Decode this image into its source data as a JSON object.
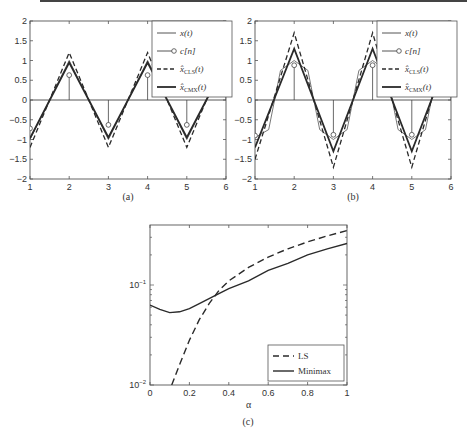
{
  "figure": {
    "captions": [
      "(a)",
      "(b)",
      "(c)"
    ]
  },
  "chart_data": [
    {
      "type": "line",
      "panel": "(a)",
      "title": "",
      "xlabel": "",
      "ylabel": "",
      "xlim": [
        1,
        6
      ],
      "ylim": [
        -2,
        2
      ],
      "xticks": [
        "1",
        "2",
        "3",
        "4",
        "5",
        "6"
      ],
      "yticks": [
        "-2",
        "-1.5",
        "-1",
        "-0.5",
        "0",
        "0.5",
        "1",
        "1.5",
        "2"
      ],
      "grid": false,
      "legend_position": "upper right",
      "legend": [
        "x(t)",
        "c[n]",
        "x̂_CLS(t)",
        "x̂_CMX(t)"
      ],
      "series": [
        {
          "name": "x(t)",
          "style": "thin solid",
          "x": [
            1,
            1.5,
            2,
            2.5,
            3,
            3.5,
            4,
            4.5,
            5,
            5.5,
            6
          ],
          "values": [
            -1,
            0,
            1,
            0,
            -1,
            0,
            1,
            0,
            -1,
            0,
            1
          ]
        },
        {
          "name": "c[n]",
          "style": "stem",
          "x": [
            1,
            2,
            3,
            4,
            5,
            6
          ],
          "values": [
            -0.72,
            0.63,
            -0.63,
            0.63,
            -0.63,
            0.63
          ]
        },
        {
          "name": "x̂_CLS(t)",
          "style": "dashed",
          "x": [
            1,
            2,
            3,
            4,
            5,
            6
          ],
          "values": [
            -1.2,
            1.2,
            -1.2,
            1.2,
            -1.2,
            1.2
          ]
        },
        {
          "name": "x̂_CMX(t)",
          "style": "thick solid",
          "x": [
            1,
            2,
            3,
            4,
            5,
            6
          ],
          "values": [
            -0.97,
            0.95,
            -0.95,
            0.95,
            -0.95,
            0.95
          ]
        }
      ]
    },
    {
      "type": "line",
      "panel": "(b)",
      "title": "",
      "xlabel": "",
      "ylabel": "",
      "xlim": [
        1,
        6
      ],
      "ylim": [
        -2,
        2
      ],
      "xticks": [
        "1",
        "2",
        "3",
        "4",
        "5",
        "6"
      ],
      "yticks": [
        "-2",
        "-1.5",
        "-1",
        "-0.5",
        "0",
        "0.5",
        "1",
        "1.5",
        "2"
      ],
      "grid": false,
      "legend_position": "upper right",
      "legend": [
        "x(t)",
        "c[n]",
        "x̂_CLS(t)",
        "x̂_CMX(t)"
      ],
      "series": [
        {
          "name": "x(t)",
          "style": "thin solid (trapezoid)",
          "x": [
            1,
            1.35,
            1.65,
            2,
            2.35,
            2.65,
            3,
            3.35,
            3.65,
            4,
            4.35,
            4.65,
            5,
            5.35,
            5.65,
            6
          ],
          "values": [
            -0.95,
            -0.75,
            0.75,
            1,
            0.75,
            -0.75,
            -1,
            -0.75,
            0.75,
            1,
            0.75,
            -0.75,
            -1,
            -0.75,
            0.75,
            1
          ]
        },
        {
          "name": "c[n]",
          "style": "stem",
          "x": [
            1,
            2,
            3,
            4,
            5,
            6
          ],
          "values": [
            -0.9,
            0.88,
            -0.88,
            0.88,
            -0.88,
            0.88
          ]
        },
        {
          "name": "x̂_CLS(t)",
          "style": "dashed",
          "x": [
            1,
            2,
            3,
            4,
            5,
            6
          ],
          "values": [
            -1.5,
            1.7,
            -1.7,
            1.7,
            -1.7,
            1.7
          ]
        },
        {
          "name": "x̂_CMX(t)",
          "style": "thick solid",
          "x": [
            1,
            2,
            3,
            4,
            5,
            6
          ],
          "values": [
            -1.2,
            1.3,
            -1.3,
            1.3,
            -1.3,
            1.3
          ]
        }
      ]
    },
    {
      "type": "line",
      "panel": "(c)",
      "title": "",
      "xlabel": "α",
      "ylabel": "",
      "xlim": [
        0,
        1
      ],
      "ylim": [
        0.01,
        0.4
      ],
      "yscale": "log",
      "xticks": [
        "0",
        "0.2",
        "0.4",
        "0.6",
        "0.8",
        "1"
      ],
      "yticks": [
        "10^-2",
        "10^-1"
      ],
      "grid": false,
      "legend_position": "lower right",
      "legend": [
        "LS",
        "Minimax"
      ],
      "series": [
        {
          "name": "LS",
          "style": "dashed",
          "x": [
            0.11,
            0.15,
            0.2,
            0.25,
            0.3,
            0.35,
            0.4,
            0.5,
            0.6,
            0.7,
            0.8,
            0.9,
            1.0
          ],
          "values": [
            0.01,
            0.016,
            0.028,
            0.045,
            0.065,
            0.088,
            0.11,
            0.15,
            0.19,
            0.23,
            0.27,
            0.31,
            0.35
          ]
        },
        {
          "name": "Minimax",
          "style": "solid",
          "x": [
            0,
            0.05,
            0.1,
            0.15,
            0.2,
            0.25,
            0.3,
            0.35,
            0.4,
            0.5,
            0.6,
            0.7,
            0.8,
            0.9,
            1.0
          ],
          "values": [
            0.063,
            0.057,
            0.053,
            0.054,
            0.058,
            0.065,
            0.073,
            0.082,
            0.092,
            0.11,
            0.14,
            0.165,
            0.2,
            0.23,
            0.26
          ]
        }
      ]
    }
  ]
}
